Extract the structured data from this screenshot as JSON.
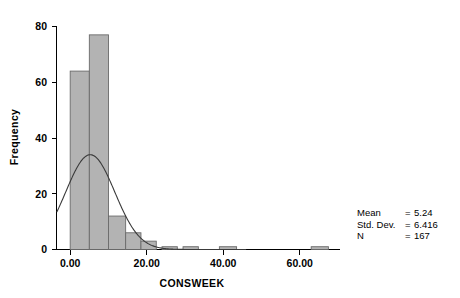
{
  "chart_data": {
    "type": "bar",
    "title": "",
    "subtitle": "",
    "xlabel": "CONSWEEK",
    "ylabel": "Frequency",
    "xlim": [
      -3.5,
      70
    ],
    "ylim": [
      0,
      85
    ],
    "grid": false,
    "legend": null,
    "bin_width": 5,
    "bin_starts": [
      0,
      5,
      10,
      15,
      20,
      25,
      30,
      38,
      63
    ],
    "categories": [
      "0-5",
      "5-10",
      "10-15",
      "15-20",
      "20-25",
      "25-30",
      "30-35",
      "38-43",
      "63-68"
    ],
    "values": [
      64,
      77,
      12,
      6,
      3,
      1,
      1,
      1,
      1
    ],
    "bars": [
      {
        "x0": 0.0,
        "x1": 5.0,
        "height": 64
      },
      {
        "x0": 5.0,
        "x1": 10.0,
        "height": 77
      },
      {
        "x0": 10.0,
        "x1": 14.5,
        "height": 12
      },
      {
        "x0": 14.5,
        "x1": 18.5,
        "height": 6
      },
      {
        "x0": 18.5,
        "x1": 22.5,
        "height": 3
      },
      {
        "x0": 24.0,
        "x1": 28.0,
        "height": 1
      },
      {
        "x0": 29.5,
        "x1": 33.5,
        "height": 1
      },
      {
        "x0": 39.0,
        "x1": 43.5,
        "height": 1
      },
      {
        "x0": 63.0,
        "x1": 67.5,
        "height": 1
      }
    ],
    "curve": {
      "type": "normal-overlay",
      "mean": 5.24,
      "std_dev": 6.416,
      "peak_value": 34,
      "left_edge_value": 13
    },
    "xticks": [
      {
        "value": 0,
        "label": "0.00"
      },
      {
        "value": 20,
        "label": "20.00"
      },
      {
        "value": 40,
        "label": "40.00"
      },
      {
        "value": 60,
        "label": "60.00"
      }
    ],
    "yticks": [
      {
        "value": 0,
        "label": "0"
      },
      {
        "value": 20,
        "label": "20"
      },
      {
        "value": 40,
        "label": "40"
      },
      {
        "value": 60,
        "label": "60"
      },
      {
        "value": 80,
        "label": "80"
      }
    ],
    "bar_fill_color": "#b3b3b3",
    "bar_edge_color": "#6a6a6a",
    "curve_color": "#3a3a3a",
    "axis_color": "#000000"
  },
  "stats": {
    "rows": [
      {
        "label": "Mean",
        "equals": "=",
        "value": "5.24"
      },
      {
        "label": "Std. Dev.",
        "equals": "=",
        "value": "6.416"
      },
      {
        "label": "N",
        "equals": "=",
        "value": "167"
      }
    ]
  }
}
